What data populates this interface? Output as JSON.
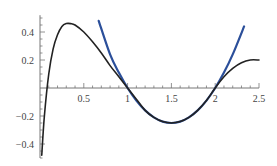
{
  "chart_data": {
    "type": "line",
    "title": "",
    "xlabel": "",
    "ylabel": "",
    "xlim": [
      0,
      2.5
    ],
    "ylim": [
      -0.5,
      0.5
    ],
    "grid": false,
    "legend": null,
    "x_ticks": [
      0.5,
      1,
      1.5,
      2,
      2.5
    ],
    "x_tick_labels": [
      "0.5",
      "1",
      "1.5",
      "2",
      "2.5"
    ],
    "y_ticks": [
      0.4,
      0.2,
      -0.2,
      -0.4
    ],
    "y_tick_labels": [
      "0.4",
      "0.2",
      "−0.2",
      "−0.4"
    ],
    "series": [
      {
        "name": "function",
        "color": "#222222",
        "x": [
          0.02,
          0.05,
          0.1,
          0.15,
          0.2,
          0.25,
          0.3,
          0.35,
          0.4,
          0.5,
          0.6,
          0.7,
          0.8,
          0.9,
          1.0,
          1.1,
          1.2,
          1.3,
          1.4,
          1.5,
          1.6,
          1.7,
          1.8,
          1.9,
          2.0,
          2.1,
          2.2,
          2.3,
          2.4,
          2.5
        ],
        "y": [
          -0.48,
          -0.2,
          0.1,
          0.28,
          0.38,
          0.44,
          0.46,
          0.46,
          0.45,
          0.4,
          0.33,
          0.25,
          0.16,
          0.08,
          0.0,
          -0.08,
          -0.16,
          -0.21,
          -0.24,
          -0.25,
          -0.24,
          -0.21,
          -0.16,
          -0.09,
          0.0,
          0.08,
          0.14,
          0.18,
          0.2,
          0.2
        ]
      },
      {
        "name": "quadratic approximation",
        "color": "#2b4f9a",
        "x": [
          0.67,
          0.8,
          0.9,
          1.0,
          1.1,
          1.2,
          1.3,
          1.4,
          1.5,
          1.6,
          1.7,
          1.8,
          1.9,
          2.0,
          2.1,
          2.2,
          2.33
        ],
        "y": [
          0.48,
          0.24,
          0.11,
          0.0,
          -0.09,
          -0.16,
          -0.21,
          -0.24,
          -0.25,
          -0.24,
          -0.21,
          -0.16,
          -0.09,
          0.0,
          0.11,
          0.24,
          0.44
        ]
      }
    ]
  }
}
